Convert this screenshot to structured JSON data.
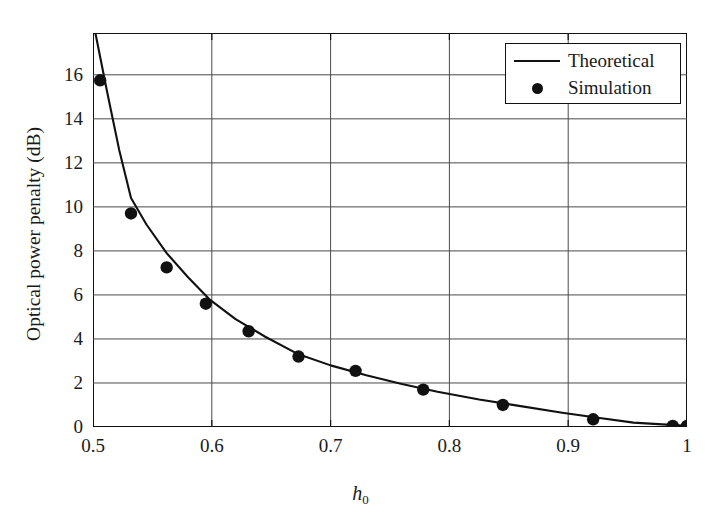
{
  "chart_data": {
    "type": "line",
    "title": "",
    "xlabel": "h0",
    "xlabel_display": "h",
    "xlabel_sub": "0",
    "ylabel": "Optical power penalty (dB)",
    "xlim": [
      0.5,
      1.0
    ],
    "ylim": [
      0,
      17.9
    ],
    "grid": true,
    "xticks": [
      0.5,
      0.6,
      0.7,
      0.8,
      0.9,
      1.0
    ],
    "xticklabels": [
      "0.5",
      "0.6",
      "0.7",
      "0.8",
      "0.9",
      "1"
    ],
    "yticks": [
      0,
      2,
      4,
      6,
      8,
      10,
      12,
      14,
      16
    ],
    "yticklabels": [
      "0",
      "2",
      "4",
      "6",
      "8",
      "10",
      "12",
      "14",
      "16"
    ],
    "legend_position": "upper right",
    "series": [
      {
        "name": "Theoretical",
        "style": "line",
        "color": "#111111",
        "x": [
          0.502,
          0.512,
          0.522,
          0.532,
          0.545,
          0.562,
          0.58,
          0.598,
          0.62,
          0.645,
          0.673,
          0.7,
          0.73,
          0.76,
          0.79,
          0.825,
          0.86,
          0.895,
          0.925,
          0.955,
          1.0
        ],
        "y": [
          17.9,
          15.2,
          12.6,
          10.4,
          9.2,
          7.9,
          6.8,
          5.8,
          4.9,
          4.1,
          3.3,
          2.8,
          2.35,
          1.95,
          1.6,
          1.25,
          0.95,
          0.65,
          0.42,
          0.2,
          0.05
        ]
      },
      {
        "name": "Simulation",
        "style": "markers",
        "color": "#111111",
        "x": [
          0.506,
          0.532,
          0.562,
          0.595,
          0.631,
          0.673,
          0.721,
          0.778,
          0.845,
          0.921,
          0.988,
          1.0
        ],
        "y": [
          15.75,
          9.7,
          7.25,
          5.6,
          4.35,
          3.2,
          2.55,
          1.7,
          1.0,
          0.35,
          0.05,
          0.05
        ]
      }
    ]
  },
  "legend": {
    "items": [
      {
        "label": "Theoretical",
        "key": "line"
      },
      {
        "label": "Simulation",
        "key": "dot"
      }
    ]
  }
}
